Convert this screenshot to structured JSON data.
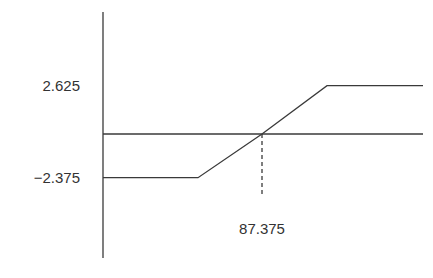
{
  "chart_data": {
    "type": "line",
    "title": "",
    "xlabel": "",
    "ylabel": "",
    "x": [
      80,
      85,
      87.375,
      90,
      95
    ],
    "series": [
      {
        "name": "payoff",
        "values": [
          -2.375,
          -2.375,
          0,
          2.625,
          2.625
        ]
      }
    ],
    "xlim": [
      80,
      95
    ],
    "ylim": [
      -5.5,
      5.5
    ],
    "y_tick_labels": [
      "2.625",
      "−2.375"
    ],
    "y_ticks": [
      2.625,
      -2.375
    ],
    "annotations": [
      {
        "text": "87.375",
        "x": 87.375,
        "y": 0,
        "style": "dashed-drop-line"
      }
    ],
    "grid": false,
    "legend": "none"
  }
}
